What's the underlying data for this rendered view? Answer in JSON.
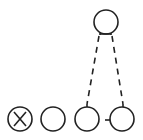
{
  "diagram": {
    "type": "node-link",
    "stroke_color": "#222222",
    "background": "#ffffff",
    "nodes": [
      {
        "id": "top",
        "label": "",
        "marker": ""
      },
      {
        "id": "b1",
        "label": "X",
        "marker": "X"
      },
      {
        "id": "b2",
        "label": "",
        "marker": ""
      },
      {
        "id": "b3",
        "label": "",
        "marker": ""
      },
      {
        "id": "b4",
        "label": "",
        "marker": ""
      }
    ],
    "edges": [
      {
        "from": "top",
        "to": "b3",
        "style": "dashed"
      },
      {
        "from": "top",
        "to": "b4",
        "style": "dashed"
      },
      {
        "from": "b3",
        "to": "b4",
        "style": "solid-short"
      }
    ]
  }
}
